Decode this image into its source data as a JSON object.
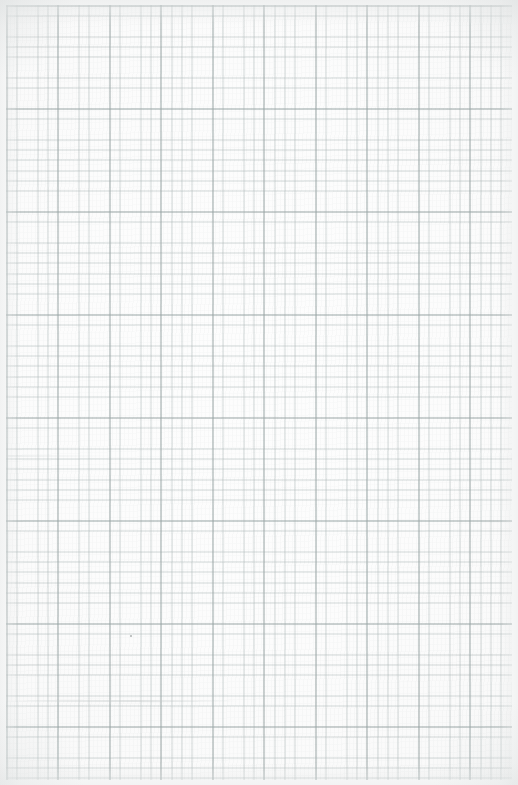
{
  "document": {
    "type": "grid-paper-scan",
    "description": "Blank sheet of squared graph paper, scanned",
    "width_px": 518,
    "height_px": 785,
    "visible_text": "",
    "orientation": "portrait"
  },
  "paper": {
    "background_color": "#fcfcfc",
    "base_highlight_color": "#fdfdfd",
    "edge_tone_color": "#f7f7f7",
    "margin_color": "#fdfdfd",
    "margin_top_px": 5,
    "margin_bottom_px": 5,
    "margin_left_px": 6,
    "margin_right_px": 6
  },
  "grid": {
    "minor_cell_px": 10.3,
    "minor_line_color": "#b0baba",
    "minor_line_width_px": 0.7,
    "major_every_n_cells": 5,
    "major_cell_px": 51.5,
    "major_line_color": "#96a2a2",
    "major_line_width_px": 0.9
  },
  "artifacts": {
    "speck": {
      "label": "ink-speck",
      "x_px": 130,
      "y_px": 635,
      "size_px": 2,
      "color": "#8a8e8e"
    },
    "streaks": [
      {
        "label": "scan-streak-lower",
        "y_px": 700,
        "color": "#bec4c4"
      },
      {
        "label": "scan-streak-middle",
        "y_px": 455,
        "color": "#c7cdcd"
      },
      {
        "label": "scan-streak-upper",
        "y_px": 250,
        "color": "#cbd0d0"
      }
    ]
  },
  "vignette": {
    "corner_shade_color": "#dee1e1",
    "edge_shade_color": "#e4e6e6"
  }
}
